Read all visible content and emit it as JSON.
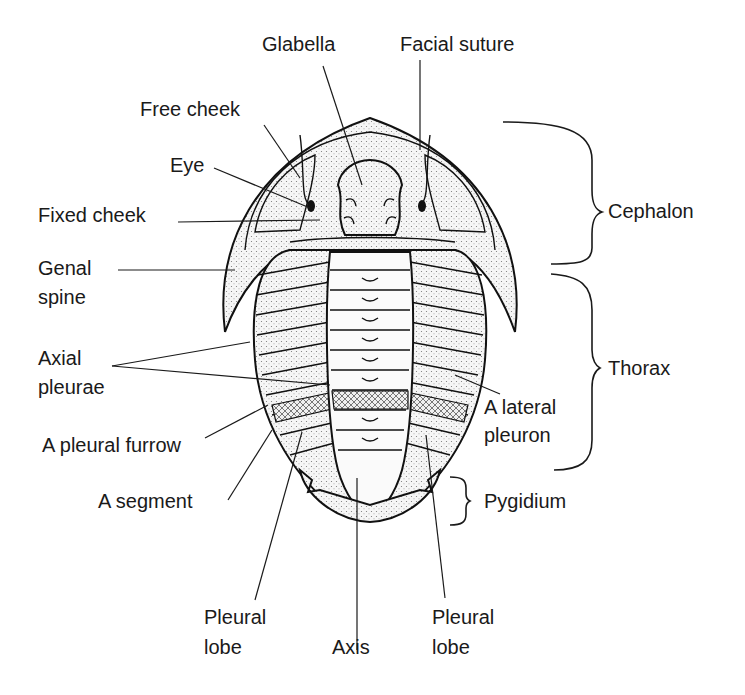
{
  "diagram": {
    "labels": {
      "glabella": "Glabella",
      "facial_suture": "Facial suture",
      "free_cheek": "Free cheek",
      "eye": "Eye",
      "fixed_cheek": "Fixed cheek",
      "genal_spine_line1": "Genal",
      "genal_spine_line2": "spine",
      "axial_pleurae_line1": "Axial",
      "axial_pleurae_line2": "pleurae",
      "pleural_furrow": "A pleural furrow",
      "segment": "A segment",
      "pleural_lobe_left_line1": "Pleural",
      "pleural_lobe_left_line2": "lobe",
      "axis": "Axis",
      "pleural_lobe_right_line1": "Pleural",
      "pleural_lobe_right_line2": "lobe",
      "lateral_pleuron_line1": "A lateral",
      "lateral_pleuron_line2": "pleuron"
    },
    "regions": {
      "cephalon": "Cephalon",
      "thorax": "Thorax",
      "pygidium": "Pygidium"
    },
    "colors": {
      "ink": "#1a1a1a",
      "background": "#ffffff",
      "stipple": "#e2e2e2"
    }
  }
}
